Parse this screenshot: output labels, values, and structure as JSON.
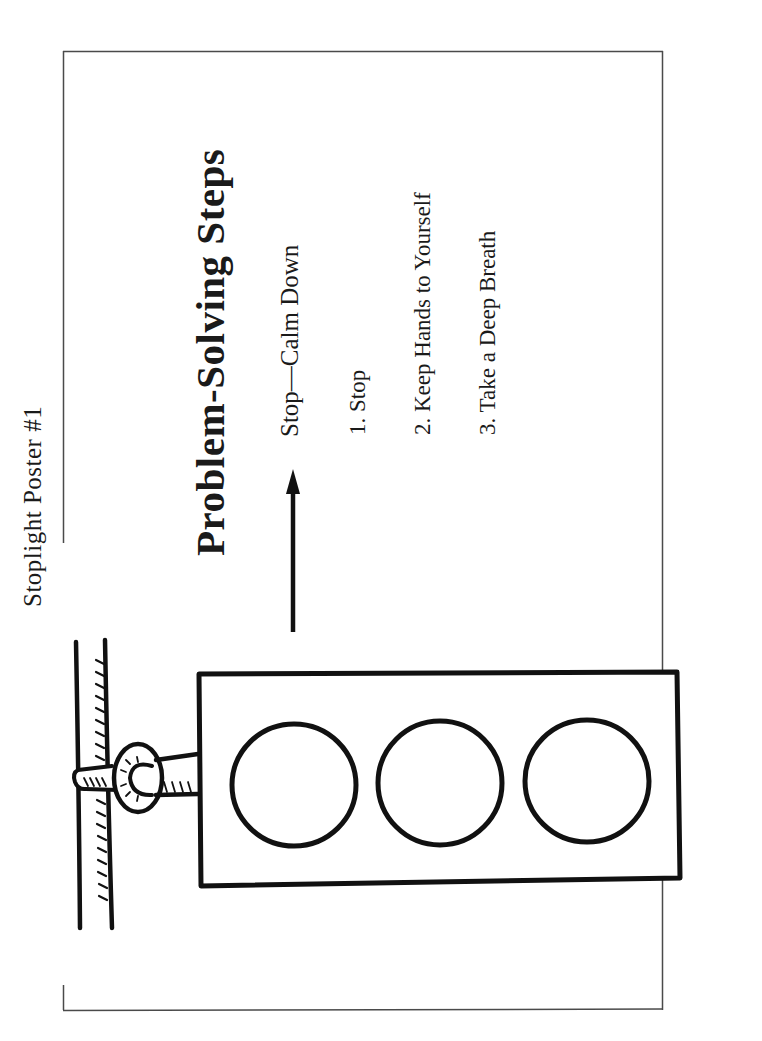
{
  "document": {
    "poster_label": "Stoplight Poster #1",
    "title": "Problem-Solving Steps",
    "phase": {
      "label": "Stop—Calm Down",
      "indicator": "arrow-up-icon"
    },
    "steps": [
      {
        "label": "1. Stop"
      },
      {
        "label": "2. Keep Hands to Yourself"
      },
      {
        "label": "3. Take a Deep Breath"
      }
    ],
    "illustration": {
      "name": "stoplight",
      "lights": [
        "light-1",
        "light-2",
        "light-3"
      ],
      "stroke_color": "#111111"
    },
    "colors": {
      "background": "#ffffff",
      "text": "#1a1a1a",
      "frame": "#4a4a4a"
    }
  }
}
